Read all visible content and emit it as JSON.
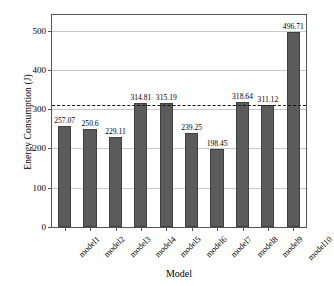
{
  "chart_data": {
    "type": "bar",
    "title": "",
    "xlabel": "Model",
    "ylabel": "Energy Consumption (J)",
    "categories": [
      "model1",
      "model2",
      "model3",
      "model4",
      "model5",
      "model6",
      "model7",
      "model8",
      "model9",
      "model10"
    ],
    "values": [
      257.07,
      250.6,
      229.11,
      314.81,
      315.19,
      239.25,
      198.45,
      318.64,
      311.12,
      496.71
    ],
    "value_labels": [
      "257.07",
      "250.6",
      "229.11",
      "314.81",
      "315.19",
      "239.25",
      "198.45",
      "318.64",
      "311.12",
      "496.71"
    ],
    "ylim": [
      0,
      540
    ],
    "yticks": [
      0,
      100,
      200,
      300,
      400,
      500
    ],
    "ytick_labels": [
      "0",
      "100",
      "200",
      "300",
      "400",
      "500"
    ],
    "grid": "horizontal",
    "legend": "none",
    "bar_color": "#5b5b5b",
    "bar_edge_color": "#3f3f3f",
    "gridline_color": "#c9c9c9",
    "axis_color": "#555555",
    "reference_line": {
      "value": 311.0,
      "style": "dashed",
      "color": "#111111",
      "label": ""
    }
  }
}
